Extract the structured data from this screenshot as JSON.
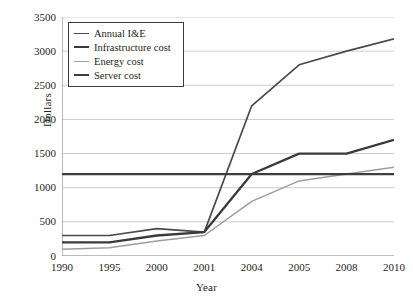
{
  "chart_data": {
    "type": "line",
    "title": "",
    "xlabel": "Year",
    "ylabel": "Dollars",
    "categories": [
      "1990",
      "1995",
      "2000",
      "2001",
      "2004",
      "2005",
      "2008",
      "2010"
    ],
    "ylim": [
      0,
      3500
    ],
    "yticks": [
      "0",
      "500",
      "1000",
      "1500",
      "2000",
      "2500",
      "3000",
      "3500"
    ],
    "grid": "horizontal",
    "legend_position": "top-left",
    "series": [
      {
        "name": "Annual I&E",
        "color": "#4a4a4a",
        "width": 1.7,
        "values": [
          300,
          300,
          400,
          350,
          2200,
          2800,
          3000,
          3180
        ]
      },
      {
        "name": "Infrastructure cost",
        "color": "#3a3a3a",
        "width": 2.3,
        "values": [
          200,
          200,
          300,
          350,
          1200,
          1500,
          1500,
          1700
        ]
      },
      {
        "name": "Energy cost",
        "color": "#9d9d9d",
        "width": 1.5,
        "values": [
          100,
          120,
          220,
          300,
          800,
          1100,
          1200,
          1300
        ]
      },
      {
        "name": "Server cost",
        "color": "#3d3d3d",
        "width": 2.3,
        "values": [
          1200,
          1200,
          1200,
          1200,
          1200,
          1200,
          1200,
          1200
        ]
      }
    ]
  },
  "axes": {
    "grid_color": "#bfbfbf",
    "axis_color": "#7a7a7a"
  }
}
